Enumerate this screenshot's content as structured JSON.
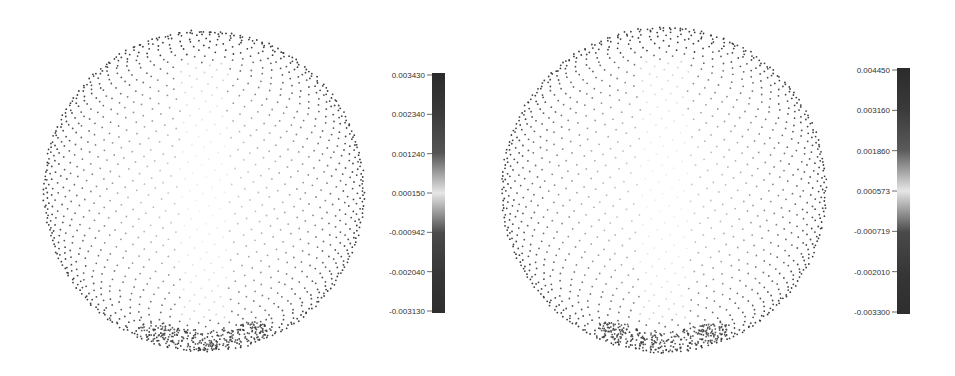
{
  "chart_data": [
    {
      "type": "scatter",
      "title": "",
      "description": "3D point cloud of a sphere, points colored by value (grayscale colormap: dark at extremes, light near center value)",
      "colorbar": {
        "ticks": [
          "0.003430",
          "0.002340",
          "0.001240",
          "0.000150",
          "-0.000942",
          "-0.002040",
          "-0.003130"
        ],
        "range": [
          -0.00313,
          0.00343
        ],
        "colors": [
          "#2b2b2b",
          "#3a3a3a",
          "#555555",
          "#e6e6e6",
          "#4a4a4a",
          "#363636",
          "#2e2e2e"
        ]
      }
    },
    {
      "type": "scatter",
      "title": "",
      "description": "3D point cloud of a sphere, points colored by value (grayscale colormap: dark at extremes, light near center value)",
      "colorbar": {
        "ticks": [
          "0.004450",
          "0.003160",
          "0.001860",
          "0.000573",
          "-0.000719",
          "-0.002010",
          "-0.003300"
        ],
        "range": [
          -0.0033,
          0.00445
        ],
        "colors": [
          "#2b2b2b",
          "#3a3a3a",
          "#5a5a5a",
          "#e6e6e6",
          "#4a4a4a",
          "#363636",
          "#2e2e2e"
        ]
      }
    }
  ],
  "style": {
    "point_color": "#3c3c3c",
    "background": "#ffffff"
  }
}
